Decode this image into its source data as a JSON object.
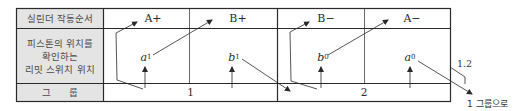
{
  "table": {
    "row_labels": {
      "sequence": "실린더 작동순서",
      "limit_switch_line1": "피스톤의 위치를",
      "limit_switch_line2": "확인하는",
      "limit_switch_line3": "리밋 스위치 위치",
      "group": "그      룹"
    },
    "operations": [
      "A+",
      "B+",
      "B−",
      "A−"
    ],
    "switches": [
      {
        "letter": "a",
        "sub": "1"
      },
      {
        "letter": "b",
        "sub": "1"
      },
      {
        "letter": "b",
        "sub": "0"
      },
      {
        "letter": "a",
        "sub": "0"
      }
    ],
    "groups": [
      "1",
      "2"
    ]
  },
  "annotations": {
    "feedback_label": "1.2",
    "return_label": "1 그룹으로"
  },
  "colors": {
    "line": "#2a2a2a",
    "label_bg": "#e4e4e4"
  }
}
